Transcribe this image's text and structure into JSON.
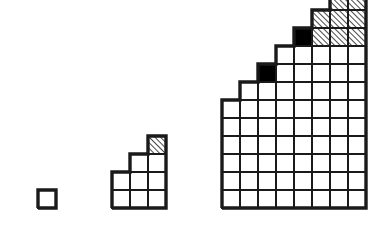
{
  "document": {
    "title": "Staircase Square Diagrams",
    "description": "Three geometric figures made of unit squares arranged in increasing staircase patterns",
    "background_color": "#ffffff",
    "stroke_color": "#1a1a1a",
    "fill_white": "#ffffff",
    "fill_black": "#000000",
    "hatch_color": "#1a1a1a"
  },
  "chart_data": {
    "type": "diagram",
    "cell_size": 18,
    "stroke_width": 2,
    "figures": [
      {
        "name": "figure-1",
        "label": "n = 1",
        "origin_x": 38,
        "baseline_y": 208,
        "columns": 1,
        "column_heights": [
          1
        ],
        "cells": [
          {
            "col": 0,
            "row": 0,
            "fill": "white"
          }
        ]
      },
      {
        "name": "figure-2",
        "label": "n = 2",
        "origin_x": 112,
        "baseline_y": 208,
        "columns": 3,
        "column_heights": [
          2,
          3,
          4
        ],
        "cells": [
          {
            "col": 0,
            "row": 0,
            "fill": "white"
          },
          {
            "col": 0,
            "row": 1,
            "fill": "white"
          },
          {
            "col": 1,
            "row": 0,
            "fill": "white"
          },
          {
            "col": 1,
            "row": 1,
            "fill": "white"
          },
          {
            "col": 1,
            "row": 2,
            "fill": "white"
          },
          {
            "col": 2,
            "row": 0,
            "fill": "white"
          },
          {
            "col": 2,
            "row": 1,
            "fill": "white"
          },
          {
            "col": 2,
            "row": 2,
            "fill": "white"
          },
          {
            "col": 2,
            "row": 3,
            "fill": "hatched"
          }
        ]
      },
      {
        "name": "figure-3",
        "label": "n = 3",
        "origin_x": 222,
        "baseline_y": 208,
        "columns": 8,
        "column_heights": [
          6,
          7,
          8,
          9,
          10,
          11,
          12,
          13
        ],
        "cells": [
          {
            "col": 0,
            "row": 0,
            "fill": "white"
          },
          {
            "col": 0,
            "row": 1,
            "fill": "white"
          },
          {
            "col": 0,
            "row": 2,
            "fill": "white"
          },
          {
            "col": 0,
            "row": 3,
            "fill": "white"
          },
          {
            "col": 0,
            "row": 4,
            "fill": "white"
          },
          {
            "col": 0,
            "row": 5,
            "fill": "white"
          },
          {
            "col": 1,
            "row": 0,
            "fill": "white"
          },
          {
            "col": 1,
            "row": 1,
            "fill": "white"
          },
          {
            "col": 1,
            "row": 2,
            "fill": "white"
          },
          {
            "col": 1,
            "row": 3,
            "fill": "white"
          },
          {
            "col": 1,
            "row": 4,
            "fill": "white"
          },
          {
            "col": 1,
            "row": 5,
            "fill": "white"
          },
          {
            "col": 1,
            "row": 6,
            "fill": "white"
          },
          {
            "col": 2,
            "row": 0,
            "fill": "white"
          },
          {
            "col": 2,
            "row": 1,
            "fill": "white"
          },
          {
            "col": 2,
            "row": 2,
            "fill": "white"
          },
          {
            "col": 2,
            "row": 3,
            "fill": "white"
          },
          {
            "col": 2,
            "row": 4,
            "fill": "white"
          },
          {
            "col": 2,
            "row": 5,
            "fill": "white"
          },
          {
            "col": 2,
            "row": 6,
            "fill": "white"
          },
          {
            "col": 2,
            "row": 7,
            "fill": "black"
          },
          {
            "col": 3,
            "row": 0,
            "fill": "white"
          },
          {
            "col": 3,
            "row": 1,
            "fill": "white"
          },
          {
            "col": 3,
            "row": 2,
            "fill": "white"
          },
          {
            "col": 3,
            "row": 3,
            "fill": "white"
          },
          {
            "col": 3,
            "row": 4,
            "fill": "white"
          },
          {
            "col": 3,
            "row": 5,
            "fill": "white"
          },
          {
            "col": 3,
            "row": 6,
            "fill": "white"
          },
          {
            "col": 3,
            "row": 7,
            "fill": "white"
          },
          {
            "col": 3,
            "row": 8,
            "fill": "white"
          },
          {
            "col": 4,
            "row": 0,
            "fill": "white"
          },
          {
            "col": 4,
            "row": 1,
            "fill": "white"
          },
          {
            "col": 4,
            "row": 2,
            "fill": "white"
          },
          {
            "col": 4,
            "row": 3,
            "fill": "white"
          },
          {
            "col": 4,
            "row": 4,
            "fill": "white"
          },
          {
            "col": 4,
            "row": 5,
            "fill": "white"
          },
          {
            "col": 4,
            "row": 6,
            "fill": "white"
          },
          {
            "col": 4,
            "row": 7,
            "fill": "white"
          },
          {
            "col": 4,
            "row": 8,
            "fill": "white"
          },
          {
            "col": 4,
            "row": 9,
            "fill": "black"
          },
          {
            "col": 5,
            "row": 0,
            "fill": "white"
          },
          {
            "col": 5,
            "row": 1,
            "fill": "white"
          },
          {
            "col": 5,
            "row": 2,
            "fill": "white"
          },
          {
            "col": 5,
            "row": 3,
            "fill": "white"
          },
          {
            "col": 5,
            "row": 4,
            "fill": "white"
          },
          {
            "col": 5,
            "row": 5,
            "fill": "white"
          },
          {
            "col": 5,
            "row": 6,
            "fill": "white"
          },
          {
            "col": 5,
            "row": 7,
            "fill": "white"
          },
          {
            "col": 5,
            "row": 8,
            "fill": "white"
          },
          {
            "col": 5,
            "row": 9,
            "fill": "hatched"
          },
          {
            "col": 5,
            "row": 10,
            "fill": "hatched"
          },
          {
            "col": 6,
            "row": 0,
            "fill": "white"
          },
          {
            "col": 6,
            "row": 1,
            "fill": "white"
          },
          {
            "col": 6,
            "row": 2,
            "fill": "white"
          },
          {
            "col": 6,
            "row": 3,
            "fill": "white"
          },
          {
            "col": 6,
            "row": 4,
            "fill": "white"
          },
          {
            "col": 6,
            "row": 5,
            "fill": "white"
          },
          {
            "col": 6,
            "row": 6,
            "fill": "white"
          },
          {
            "col": 6,
            "row": 7,
            "fill": "white"
          },
          {
            "col": 6,
            "row": 8,
            "fill": "white"
          },
          {
            "col": 6,
            "row": 9,
            "fill": "hatched"
          },
          {
            "col": 6,
            "row": 10,
            "fill": "hatched"
          },
          {
            "col": 6,
            "row": 11,
            "fill": "hatched"
          },
          {
            "col": 7,
            "row": 0,
            "fill": "white"
          },
          {
            "col": 7,
            "row": 1,
            "fill": "white"
          },
          {
            "col": 7,
            "row": 2,
            "fill": "white"
          },
          {
            "col": 7,
            "row": 3,
            "fill": "white"
          },
          {
            "col": 7,
            "row": 4,
            "fill": "white"
          },
          {
            "col": 7,
            "row": 5,
            "fill": "white"
          },
          {
            "col": 7,
            "row": 6,
            "fill": "white"
          },
          {
            "col": 7,
            "row": 7,
            "fill": "white"
          },
          {
            "col": 7,
            "row": 8,
            "fill": "white"
          },
          {
            "col": 7,
            "row": 9,
            "fill": "hatched"
          },
          {
            "col": 7,
            "row": 10,
            "fill": "hatched"
          },
          {
            "col": 7,
            "row": 11,
            "fill": "hatched"
          },
          {
            "col": 7,
            "row": 12,
            "fill": "black"
          }
        ]
      }
    ]
  }
}
